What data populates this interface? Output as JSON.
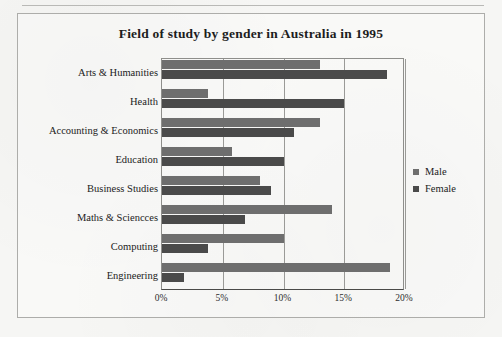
{
  "figure": {
    "title": "Field of study by gender in Australia in 1995"
  },
  "legend": {
    "position": "right",
    "items": [
      {
        "label": "Male",
        "color": "#6e6e6e",
        "swatch_name": "male-swatch"
      },
      {
        "label": "Female",
        "color": "#4a4a4a",
        "swatch_name": "female-swatch"
      }
    ]
  },
  "axis": {
    "x_ticks": [
      "0%",
      "5%",
      "10%",
      "15%",
      "20%"
    ]
  },
  "chart_data": {
    "type": "bar",
    "orientation": "horizontal",
    "title": "Field of study by gender in Australia in 1995",
    "xlabel": "",
    "ylabel": "",
    "xlim": [
      0,
      20
    ],
    "x_unit": "%",
    "x_ticks": [
      0,
      5,
      10,
      15,
      20
    ],
    "x_tick_labels": [
      "0%",
      "5%",
      "10%",
      "15%",
      "20%"
    ],
    "grid": "vertical",
    "legend_position": "right",
    "categories": [
      "Arts & Humanities",
      "Health",
      "Accounting & Economics",
      "Education",
      "Business Studies",
      "Maths & Sciencces",
      "Computing",
      "Engineering"
    ],
    "series": [
      {
        "name": "Male",
        "color": "#6e6e6e",
        "values": [
          13.0,
          3.8,
          13.0,
          5.8,
          8.1,
          14.0,
          10.0,
          18.8
        ]
      },
      {
        "name": "Female",
        "color": "#4a4a4a",
        "values": [
          18.5,
          15.0,
          10.9,
          10.0,
          9.0,
          6.8,
          3.8,
          1.8
        ]
      }
    ]
  }
}
